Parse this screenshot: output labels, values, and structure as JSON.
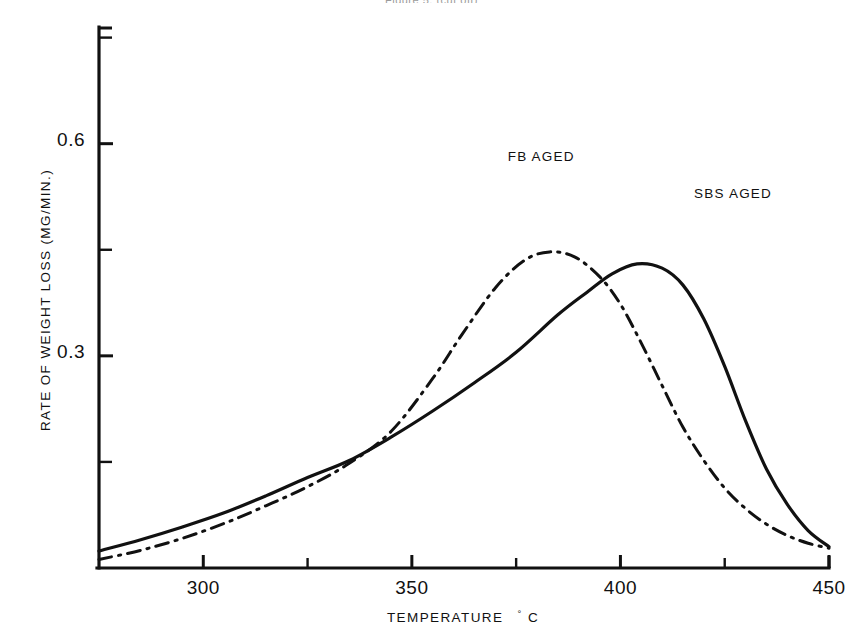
{
  "figure": {
    "top_caption_fragment": "Figure 5. (cut off)",
    "background_color": "#ffffff",
    "ink_color": "#111111"
  },
  "chart_data": {
    "type": "line",
    "title": "",
    "xlabel": "TEMPERATURE °C",
    "xlabel_main": "TEMPERATURE",
    "xlabel_degree": "°",
    "xlabel_unit": "C",
    "ylabel": "RATE OF WEIGHT LOSS (MG/MIN.)",
    "xlim": [
      275,
      450
    ],
    "ylim": [
      0.0,
      0.765
    ],
    "grid": false,
    "legend_position": "inline-annotation",
    "x_ticks_major": [
      300,
      350,
      400,
      450
    ],
    "x_tick_labels": [
      "300",
      "350",
      "400",
      "450"
    ],
    "x_ticks_minor": [
      325,
      375,
      425
    ],
    "y_ticks_major": [
      0.3,
      0.6
    ],
    "y_tick_labels": [
      "0.3",
      "0.6"
    ],
    "y_ticks_minor": [
      0.15,
      0.45,
      0.75
    ],
    "series": [
      {
        "name": "FB AGED",
        "label": "FB AGED",
        "style": "dash-dot",
        "color": "#111111",
        "peak_x": 383,
        "peak_y": 0.447,
        "x": [
          275,
          285,
          295,
          305,
          315,
          325,
          335,
          345,
          355,
          362,
          370,
          377,
          383,
          389,
          395,
          400,
          405,
          410,
          415,
          420,
          425,
          430,
          435,
          440,
          445,
          450
        ],
        "y": [
          0.012,
          0.025,
          0.042,
          0.063,
          0.088,
          0.115,
          0.148,
          0.193,
          0.268,
          0.33,
          0.396,
          0.435,
          0.447,
          0.44,
          0.412,
          0.373,
          0.318,
          0.258,
          0.199,
          0.152,
          0.113,
          0.084,
          0.062,
          0.046,
          0.035,
          0.028
        ]
      },
      {
        "name": "SBS AGED",
        "label": "SBS AGED",
        "style": "solid",
        "color": "#111111",
        "peak_x": 404,
        "peak_y": 0.43,
        "x": [
          275,
          285,
          295,
          305,
          315,
          325,
          335,
          345,
          355,
          365,
          375,
          385,
          392,
          398,
          404,
          410,
          415,
          420,
          425,
          430,
          435,
          440,
          445,
          450
        ],
        "y": [
          0.024,
          0.04,
          0.058,
          0.078,
          0.102,
          0.128,
          0.152,
          0.185,
          0.222,
          0.262,
          0.305,
          0.358,
          0.39,
          0.416,
          0.43,
          0.424,
          0.4,
          0.352,
          0.285,
          0.208,
          0.14,
          0.09,
          0.053,
          0.03
        ]
      }
    ],
    "annotations": [
      {
        "text": "FB AGED",
        "x": 381,
        "y": 0.575
      },
      {
        "text": "SBS AGED",
        "x": 427,
        "y": 0.523
      }
    ]
  }
}
